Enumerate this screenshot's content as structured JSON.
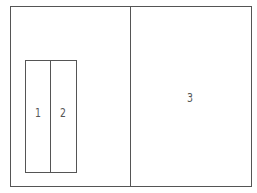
{
  "diagram": {
    "title": "",
    "regions": [
      {
        "id": "1",
        "label": "1"
      },
      {
        "id": "2",
        "label": "2"
      },
      {
        "id": "3",
        "label": "3"
      }
    ],
    "line_color": "#555555",
    "background": "#ffffff"
  }
}
